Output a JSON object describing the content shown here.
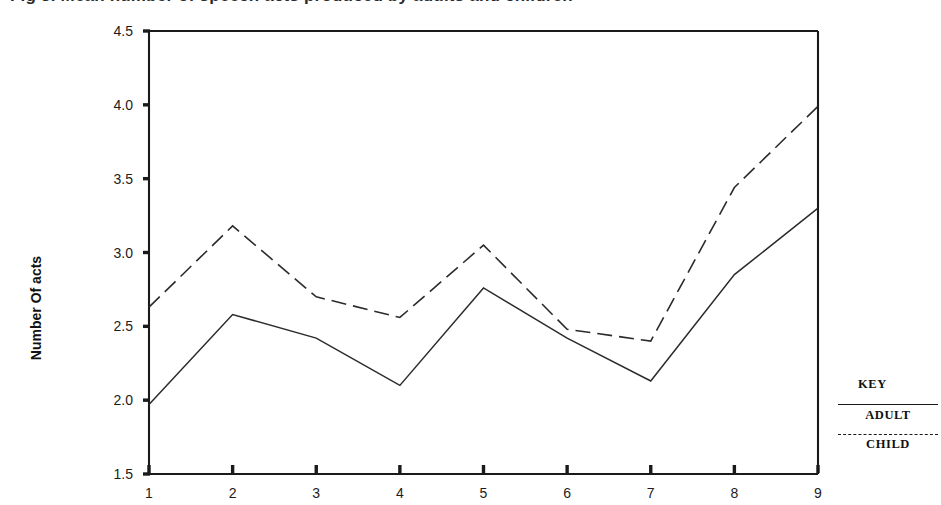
{
  "figure": {
    "title_cropped": "Fig 3. Mean number of speech acts produced by adults and children",
    "ylabel": "Number Of acts"
  },
  "legend": {
    "key_label": "KEY",
    "entries": [
      {
        "name": "adult",
        "label": "ADULT",
        "style": "solid"
      },
      {
        "name": "child",
        "label": "CHILD",
        "style": "dashed"
      }
    ]
  },
  "chart_data": {
    "type": "line",
    "title": "Fig 3. Mean number of speech acts produced by adults and children",
    "xlabel": "",
    "ylabel": "Number Of acts",
    "x": [
      1,
      2,
      3,
      4,
      5,
      6,
      7,
      8,
      9
    ],
    "xtick_labels": [
      "1",
      "2",
      "3",
      "4",
      "5",
      "6",
      "7",
      "8",
      "9"
    ],
    "ytick_labels": [
      "4.5",
      "4.0",
      "3.5",
      "3.0",
      "2.5",
      "2.0",
      "1.5"
    ],
    "ytick_values": [
      4.5,
      4.0,
      3.5,
      3.0,
      2.5,
      2.0,
      1.5
    ],
    "xlim": [
      1,
      9
    ],
    "ylim": [
      1.5,
      4.5
    ],
    "grid": false,
    "legend_position": "right",
    "series": [
      {
        "name": "ADULT",
        "style": "solid",
        "values": [
          1.97,
          2.58,
          2.42,
          2.1,
          2.76,
          2.42,
          2.13,
          2.85,
          3.3
        ]
      },
      {
        "name": "CHILD",
        "style": "dashed",
        "values": [
          2.63,
          3.18,
          2.7,
          2.56,
          3.05,
          2.48,
          2.4,
          3.44,
          3.99
        ]
      }
    ]
  }
}
